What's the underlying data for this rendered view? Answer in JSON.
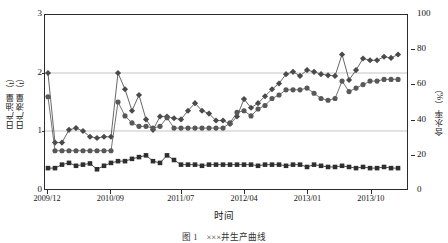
{
  "chart_data": {
    "type": "line",
    "title": "",
    "xlabel": "时间",
    "ylabel_left": "日产液量（t）/ 日产油量（t）",
    "ylabel_left_parts": [
      "日产液量（t）",
      "日产油量（t）"
    ],
    "ylabel_right": "含水率（%）",
    "ylim_left": [
      0,
      3
    ],
    "ylim_right": [
      0,
      100
    ],
    "yticks_left": [
      0,
      1,
      2,
      3
    ],
    "yticks_right": [
      0,
      20,
      40,
      60,
      80,
      100
    ],
    "grid": true,
    "grid_lines_left": [
      1,
      2
    ],
    "legend": "none",
    "x_tick_labels": [
      "2009/12",
      "2010/09",
      "2011/07",
      "2012/04",
      "2013/01",
      "2013/10"
    ],
    "x_tick_index": [
      0,
      9,
      19,
      28,
      37,
      46
    ],
    "n_points": 51,
    "series": [
      {
        "name": "日产液量",
        "marker": "diamond",
        "axis": "left",
        "color": "#4a4a4a",
        "values": [
          2.0,
          0.8,
          0.8,
          1.02,
          1.05,
          1.0,
          0.9,
          0.88,
          0.9,
          0.9,
          2.0,
          1.72,
          1.35,
          1.62,
          1.2,
          1.02,
          1.25,
          1.25,
          1.22,
          1.2,
          1.35,
          1.48,
          1.35,
          1.3,
          1.18,
          1.18,
          1.12,
          1.25,
          1.55,
          1.4,
          1.48,
          1.6,
          1.72,
          1.82,
          1.98,
          2.02,
          1.95,
          2.05,
          2.02,
          1.98,
          1.96,
          1.95,
          2.32,
          1.88,
          2.05,
          2.25,
          2.22,
          2.22,
          2.28,
          2.26,
          2.32
        ]
      },
      {
        "name": "含水率",
        "marker": "circle",
        "axis": "right",
        "color": "#585858",
        "values": [
          53,
          22,
          22,
          22,
          22,
          22,
          22,
          22,
          22,
          22,
          50,
          42,
          38,
          36,
          36,
          35,
          36,
          41,
          35,
          35,
          35,
          35,
          35,
          35,
          35,
          35,
          38,
          44,
          45,
          42,
          46,
          48,
          52,
          54,
          57,
          57,
          57,
          58,
          55,
          52,
          51,
          52,
          62,
          56,
          58,
          60,
          62,
          62,
          63,
          63,
          63
        ]
      },
      {
        "name": "日产油量",
        "marker": "square",
        "axis": "left",
        "color": "#2e2e2e",
        "values": [
          0.36,
          0.36,
          0.42,
          0.45,
          0.4,
          0.42,
          0.44,
          0.34,
          0.4,
          0.45,
          0.48,
          0.48,
          0.52,
          0.55,
          0.58,
          0.48,
          0.45,
          0.58,
          0.5,
          0.42,
          0.42,
          0.42,
          0.4,
          0.42,
          0.42,
          0.42,
          0.42,
          0.42,
          0.42,
          0.42,
          0.4,
          0.42,
          0.42,
          0.42,
          0.4,
          0.42,
          0.42,
          0.38,
          0.42,
          0.4,
          0.38,
          0.38,
          0.4,
          0.38,
          0.36,
          0.38,
          0.36,
          0.36,
          0.38,
          0.36,
          0.36
        ]
      }
    ]
  },
  "caption": {
    "text": "图 1　×××井生产曲线"
  },
  "colors": {
    "axis": "#2b2b2b",
    "grid": "#d9d9d9",
    "series_diamond": "#4a4a4a",
    "series_circle": "#585858",
    "series_square": "#2e2e2e",
    "background": "#ffffff"
  }
}
